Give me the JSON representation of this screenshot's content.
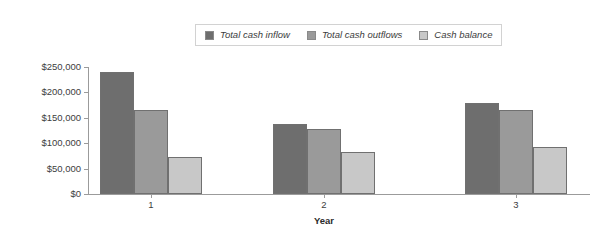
{
  "chart_data": {
    "type": "bar",
    "title": "",
    "xlabel": "Year",
    "ylabel": "",
    "categories": [
      "1",
      "2",
      "3"
    ],
    "series": [
      {
        "name": "Total cash inflow",
        "color": "#6e6e6e",
        "values": [
          240000,
          137000,
          180000
        ]
      },
      {
        "name": "Total cash outflows",
        "color": "#9a9a9a",
        "values": [
          165000,
          127000,
          166000
        ]
      },
      {
        "name": "Cash balance",
        "color": "#c8c8c8",
        "values": [
          72000,
          82000,
          93000
        ]
      }
    ],
    "ylim": [
      0,
      250000
    ],
    "ytick_values": [
      0,
      50000,
      100000,
      150000,
      200000,
      250000
    ],
    "ytick_labels": [
      "$0",
      "$50,000",
      "$100,000",
      "$150,000",
      "$200,000",
      "$250,000"
    ],
    "grid": false,
    "legend_position": "top-center"
  },
  "legend": {
    "items": [
      {
        "label": "Total cash inflow",
        "color": "#6e6e6e"
      },
      {
        "label": "Total cash outflows",
        "color": "#9a9a9a"
      },
      {
        "label": "Cash balance",
        "color": "#c8c8c8"
      }
    ]
  },
  "axis": {
    "x_title": "Year"
  }
}
